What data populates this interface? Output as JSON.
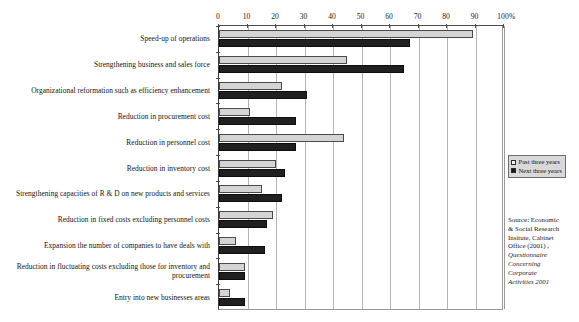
{
  "chart": {
    "type": "bar",
    "title": "",
    "orientation": "horizontal",
    "unit_label": "%",
    "axis": {
      "ticks": [
        "0",
        "10",
        "20",
        "30",
        "40",
        "50",
        "60",
        "70",
        "80",
        "90",
        "100"
      ],
      "min": 0,
      "max": 100,
      "step": 10,
      "grid": true
    },
    "legend": {
      "position": "right",
      "entries": [
        {
          "label": "Past three years",
          "color": "#f2f2f2",
          "key": "past"
        },
        {
          "label": "Next three years",
          "color": "#161616",
          "key": "next"
        }
      ]
    },
    "source": {
      "line1": "Source: Economic",
      "line2": "& Social Research",
      "line3": "Insitute, Cabinet",
      "line4": "Office (2001) ,",
      "line5_italic": "Questionnaire",
      "line6_italic": "Concerning",
      "line7_italic": "Corporate",
      "line8_italic": "Activities 2001"
    }
  },
  "chart_data": {
    "type": "bar",
    "title": "",
    "xlabel": "%",
    "ylabel": "",
    "xlim": [
      0,
      100
    ],
    "grid": true,
    "legend_position": "right",
    "categories": [
      "Speed-up of operations",
      "Strengthening business and sales force",
      "Organizational reformation such as efficiency enhancement",
      "Reduction in procurement cost",
      "Reduction in personnel cost",
      "Reduction in inventory cost",
      "Strengthening capacities of R & D on new products and services",
      "Reduction in fixed costs excluding personnel costs",
      "Expansion the number of companies to have deals with",
      "Reduction in fluctuating costs excluding those for inventory and procurement",
      "Entry into new businesses areas"
    ],
    "series": [
      {
        "name": "Past three years",
        "color": "#d4d4d4",
        "values": [
          89,
          45,
          22,
          11,
          44,
          20,
          15,
          19,
          6,
          9,
          4
        ]
      },
      {
        "name": "Next three years",
        "color": "#202020",
        "values": [
          67,
          65,
          31,
          27,
          27,
          23,
          22,
          17,
          16,
          9,
          9
        ]
      }
    ]
  }
}
